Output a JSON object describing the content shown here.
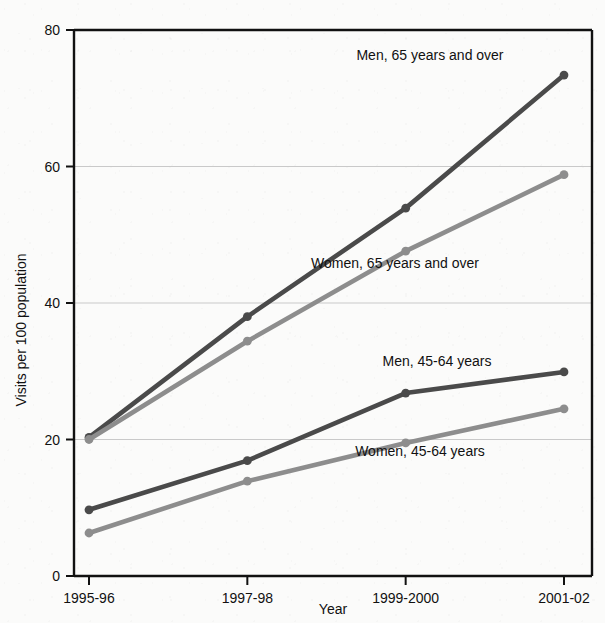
{
  "chart_data": {
    "type": "line",
    "title": "",
    "xlabel": "Year",
    "ylabel": "Visits per 100 population",
    "categories": [
      "1995-96",
      "1997-98",
      "1999-2000",
      "2001-02"
    ],
    "x_tick_labels": [
      "1995-96",
      "1997-98",
      "1999-2000",
      "2001-02"
    ],
    "y_tick_labels": [
      "0",
      "20",
      "40",
      "60",
      "80"
    ],
    "y_ticks": [
      0,
      20,
      40,
      60,
      80
    ],
    "ylim": [
      0,
      80
    ],
    "grid": "horizontal",
    "legend": "inline-labels",
    "series": [
      {
        "name": "Men, 65 years and over",
        "label": "Men, 65 years and over",
        "color": "#4a4a4a",
        "values": [
          20.3,
          38.0,
          53.9,
          73.4
        ]
      },
      {
        "name": "Women, 65 years and over",
        "label": "Women, 65 years and over",
        "color": "#8d8d8d",
        "values": [
          20.0,
          34.4,
          47.6,
          58.8
        ]
      },
      {
        "name": "Men, 45-64 years",
        "label": "Men, 45-64 years",
        "color": "#4a4a4a",
        "values": [
          9.7,
          16.9,
          26.8,
          29.9
        ]
      },
      {
        "name": "Women, 45-64 years",
        "label": "Women, 45-64 years",
        "color": "#8d8d8d",
        "values": [
          6.3,
          13.9,
          19.5,
          24.5
        ]
      }
    ],
    "annotations": [
      {
        "text": "Men, 65 years and over",
        "x": 430,
        "y": 60
      },
      {
        "text": "Women, 65 years and over",
        "x": 395,
        "y": 268
      },
      {
        "text": "Men, 45-64 years",
        "x": 437,
        "y": 366
      },
      {
        "text": "Women, 45-64 years",
        "x": 420,
        "y": 456
      }
    ]
  },
  "colors": {
    "dark_series": "#4a4a4a",
    "light_series": "#8d8d8d",
    "axis": "#111111",
    "gridline": "#c9c9c9",
    "background": "#fbfbfa"
  }
}
